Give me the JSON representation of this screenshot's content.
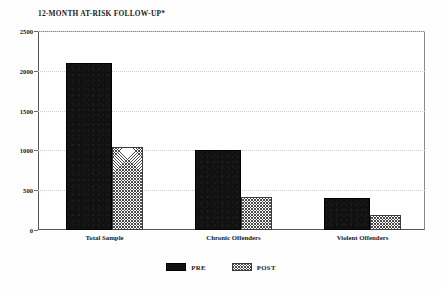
{
  "chart_data": {
    "type": "bar",
    "title": "12-MONTH AT-RISK FOLLOW-UP*",
    "xlabel": "",
    "ylabel": "",
    "ylim": [
      0,
      2500
    ],
    "yticks": [
      0,
      500,
      1000,
      1500,
      2000,
      2500
    ],
    "ytick_labels": [
      "0",
      "500",
      "1000",
      "1500",
      "2000",
      "2500"
    ],
    "grid": true,
    "legend_position": "bottom-center",
    "categories": [
      "Total Sample",
      "Chronic Offenders",
      "Violent Offenders"
    ],
    "series": [
      {
        "name": "PRE",
        "color": "#111111",
        "fill": "solid",
        "values": [
          2100,
          1010,
          400
        ]
      },
      {
        "name": "POST",
        "color": "#4a4a4a",
        "fill": "cross-hatch",
        "values": [
          1040,
          420,
          190
        ]
      }
    ]
  },
  "legend": {
    "items": [
      {
        "label": "PRE",
        "swatch": "solid-black-swatch"
      },
      {
        "label": "POST",
        "swatch": "hatched-swatch"
      }
    ]
  }
}
